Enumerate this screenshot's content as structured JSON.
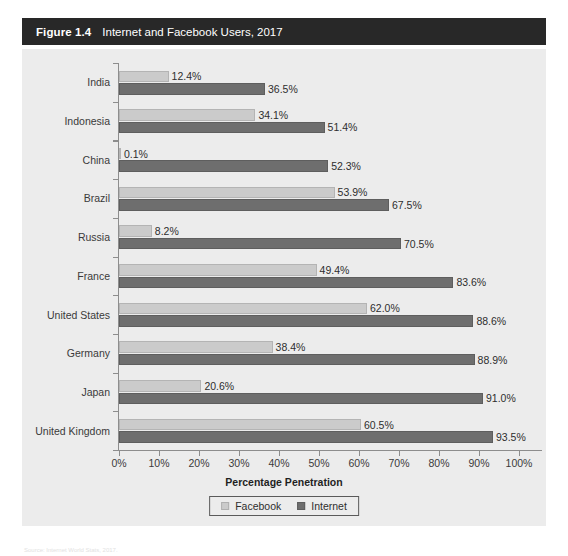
{
  "figure": {
    "number": "Figure 1.4",
    "caption": "Internet and Facebook Users, 2017"
  },
  "legend": {
    "items": [
      {
        "label": "Facebook",
        "color": "#cbcbcb",
        "swatch": "facebook"
      },
      {
        "label": "Internet",
        "color": "#6e6e6e",
        "swatch": "internet"
      }
    ]
  },
  "axis": {
    "x_title": "Percentage Penetration",
    "x_ticks": [
      "0%",
      "10%",
      "20%",
      "30%",
      "40%",
      "50%",
      "60%",
      "70%",
      "80%",
      "90%",
      "100%"
    ]
  },
  "source_note": "Source: Internet World Stats, 2017.",
  "chart_data": {
    "type": "bar",
    "orientation": "horizontal",
    "title": "Internet and Facebook Users, 2017",
    "xlabel": "Percentage Penetration",
    "ylabel": "",
    "xlim": [
      0,
      100
    ],
    "grid": false,
    "legend_position": "bottom",
    "categories": [
      "India",
      "Indonesia",
      "China",
      "Brazil",
      "Russia",
      "France",
      "United States",
      "Germany",
      "Japan",
      "United Kingdom"
    ],
    "series": [
      {
        "name": "Facebook",
        "color": "#cbcbcb",
        "values": [
          12.4,
          34.1,
          0.1,
          53.9,
          8.2,
          49.4,
          62.0,
          38.4,
          20.6,
          60.5
        ],
        "labels": [
          "12.4%",
          "34.1%",
          "0.1%",
          "53.9%",
          "8.2%",
          "49.4%",
          "62.0%",
          "38.4%",
          "20.6%",
          "60.5%"
        ]
      },
      {
        "name": "Internet",
        "color": "#6e6e6e",
        "values": [
          36.5,
          51.4,
          52.3,
          67.5,
          70.5,
          83.6,
          88.6,
          88.9,
          91.0,
          93.5
        ],
        "labels": [
          "36.5%",
          "51.4%",
          "52.3%",
          "67.5%",
          "70.5%",
          "83.6%",
          "88.6%",
          "88.9%",
          "91.0%",
          "93.5%"
        ]
      }
    ]
  }
}
